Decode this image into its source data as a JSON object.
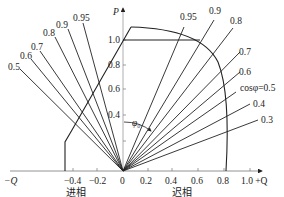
{
  "diagram": {
    "title": "",
    "axes": {
      "y_label": "P",
      "x_neg_label": "−Q",
      "x_pos_label": "1.0 +Q",
      "y_ticks": [
        "1.0",
        "0.8",
        "0.6",
        "0.4"
      ],
      "x_ticks_neg": [
        "−0.4",
        "−0.2"
      ],
      "origin": "0",
      "x_ticks_pos": [
        "0.2",
        "0.4",
        "0.6",
        "0.8"
      ]
    },
    "regions": {
      "leading": "进相",
      "lagging": "迟相"
    },
    "angle_label": "φ₀",
    "leading_pf_lines": [
      "0.5",
      "0.6",
      "0.7",
      "0.8",
      "0.9",
      "0.95"
    ],
    "lagging_pf_lines": [
      "0.95",
      "0.9",
      "0.8",
      "0.7",
      "0.6",
      "cosφ=0.5",
      "0.4",
      "0.3"
    ],
    "colors": {
      "line": "#222222",
      "axis": "#888888",
      "background": "#ffffff"
    }
  }
}
